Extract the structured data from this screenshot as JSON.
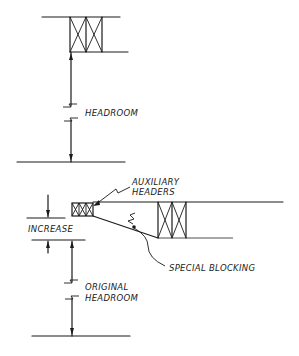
{
  "diagram": {
    "top_section": {
      "label_headroom": "HEADROOM"
    },
    "bottom_section": {
      "label_auxiliary_headers_line1": "AUXILIARY",
      "label_auxiliary_headers_line2": "HEADERS",
      "label_increase": "INCREASE",
      "label_special_blocking": "SPECIAL BLOCKING",
      "label_original_headroom_line1": "ORIGINAL",
      "label_original_headroom_line2": "HEADROOM"
    },
    "colors": {
      "ink": "#1a1a1a",
      "background": "#ffffff"
    }
  }
}
